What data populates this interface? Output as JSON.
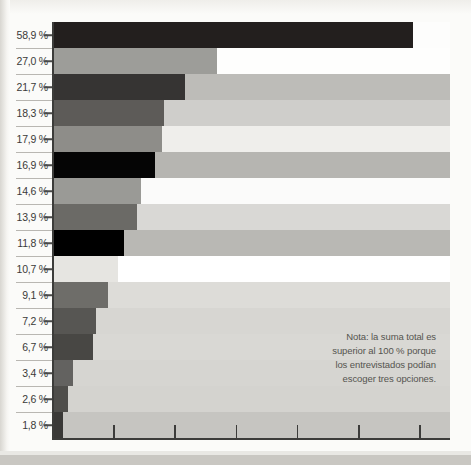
{
  "chart_data": {
    "type": "bar",
    "orientation": "horizontal",
    "title": "",
    "subtitle": "",
    "xlabel": "",
    "ylabel": "",
    "xlim": [
      0,
      65
    ],
    "grid": false,
    "legend": null,
    "categories": [
      "58,9 %",
      "27,0 %",
      "21,7 %",
      "18,3 %",
      "17,9 %",
      "16,9 %",
      "14,6 %",
      "13,9 %",
      "11,8 %",
      "10,7 %",
      "9,1 %",
      "7,2 %",
      "6,7 %",
      "3,4 %",
      "2,6 %",
      "1,8 %"
    ],
    "tick_labels": [
      "58,9 %",
      "27,0 %",
      "21,7 %",
      "18,3 %",
      "17,9 %",
      "16,9 %",
      "14,6 %",
      "13,9 %",
      "11,8 %",
      "10,7 %",
      "9,1 %",
      "7,2 %",
      "6,7 %",
      "3,4 %",
      "2,6 %",
      "1,8 %"
    ],
    "values": [
      58.9,
      27.0,
      21.7,
      18.3,
      17.9,
      16.9,
      14.6,
      13.9,
      11.8,
      10.7,
      9.1,
      7.2,
      6.7,
      3.4,
      2.6,
      1.8
    ],
    "bar_colors": [
      "#231f1e",
      "#9d9d99",
      "#363433",
      "#5d5b58",
      "#8e8d89",
      "#050505",
      "#9a9a96",
      "#6b6a66",
      "#000000",
      "#e6e5e1",
      "#6e6d69",
      "#575653",
      "#484744",
      "#636260",
      "#4f4e4b",
      "#3a3937"
    ],
    "band_colors": [
      "#fdfdfc",
      "#fefefd",
      "#bdbcb8",
      "#cfcecb",
      "#efeeeb",
      "#b6b5b1",
      "#fbfbfa",
      "#d9d8d5",
      "#b9b8b4",
      "#ffffff",
      "#dddcd8",
      "#d7d6d2",
      "#d9d8d4",
      "#d6d5d1",
      "#d4d3cf",
      "#c6c5c1"
    ],
    "xticks": [
      0,
      10,
      20,
      30,
      40,
      50,
      60
    ],
    "annotations": [
      {
        "name": "note",
        "lines": [
          "Nota: la suma total es",
          "superior al 100 % porque",
          "los entrevistados podían",
          "escoger tres opciones."
        ]
      }
    ]
  },
  "note": {
    "line1": "Nota: la suma total es",
    "line2": "superior al 100 % porque",
    "line3": "los entrevistados podían",
    "line4": "escoger tres opciones."
  }
}
